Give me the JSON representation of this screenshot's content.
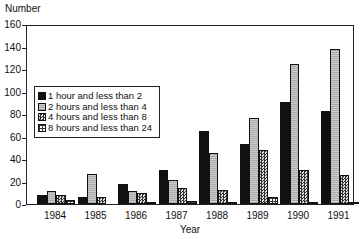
{
  "chart_data": {
    "type": "bar",
    "title": "",
    "xlabel": "Year",
    "ylabel": "Number",
    "ylim": [
      0,
      160
    ],
    "yticks": [
      0,
      20,
      40,
      60,
      80,
      100,
      120,
      140,
      160
    ],
    "grid": false,
    "legend_position": "upper left (inside plot)",
    "categories": [
      "1984",
      "1985",
      "1986",
      "1987",
      "1988",
      "1989",
      "1990",
      "1991"
    ],
    "series": [
      {
        "name": "1 hour and less than 2",
        "values": [
          8,
          6,
          18,
          31,
          66,
          54,
          92,
          84
        ]
      },
      {
        "name": "2 hours and less than 4",
        "values": [
          12,
          27,
          12,
          22,
          46,
          77,
          126,
          139
        ]
      },
      {
        "name": "4 hours and less than 8",
        "values": [
          8,
          6,
          10,
          14,
          13,
          49,
          31,
          26
        ]
      },
      {
        "name": "8 hours and less than 24",
        "values": [
          4,
          0,
          2,
          3,
          2,
          6,
          1,
          1
        ]
      }
    ]
  }
}
